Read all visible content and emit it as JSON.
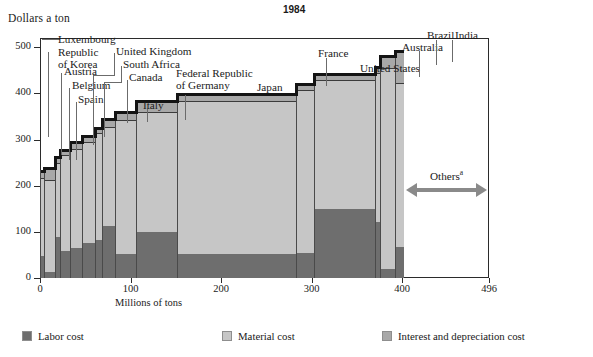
{
  "chart_title": "1984",
  "y_axis": {
    "label": "Dollars a ton",
    "ticks": [
      0,
      100,
      200,
      300,
      400,
      500
    ],
    "min": 0,
    "max": 520
  },
  "x_axis": {
    "label": "Millions of tons",
    "ticks": [
      0,
      100,
      200,
      300,
      400,
      496
    ],
    "min": 0,
    "max": 496
  },
  "legend": [
    {
      "label": "Labor cost",
      "key": "labor",
      "color": "#6e6e6e"
    },
    {
      "label": "Material cost",
      "key": "material",
      "color": "#c6c6c6"
    },
    {
      "label": "Interest and depreciation cost",
      "key": "interest",
      "color": "#a8a8a8"
    }
  ],
  "annotation": {
    "others_label": "Others",
    "others_footnote": "a",
    "others_from": 400,
    "others_to": 496
  },
  "chart_data": {
    "type": "bar",
    "subtype": "marimekko-variable-width-stacked",
    "title": "1984",
    "xlabel": "Millions of tons",
    "ylabel": "Dollars a ton",
    "xlim": [
      0,
      496
    ],
    "ylim": [
      0,
      520
    ],
    "grid": false,
    "legend_position": "bottom",
    "series": [
      {
        "name": "Labor cost",
        "color": "#6e6e6e"
      },
      {
        "name": "Material cost",
        "color": "#c6c6c6"
      },
      {
        "name": "Interest and depreciation cost",
        "color": "#a8a8a8"
      }
    ],
    "bars": [
      {
        "country": "Luxembourg",
        "x_start": 0,
        "width": 4,
        "labor": 48,
        "material": 168,
        "interest": 17,
        "total": 233
      },
      {
        "country": "Republic of Korea",
        "x_start": 4,
        "width": 13,
        "labor": 13,
        "material": 200,
        "interest": 27,
        "total": 240
      },
      {
        "country": "Austria",
        "x_start": 17,
        "width": 5,
        "labor": 88,
        "material": 162,
        "interest": 15,
        "total": 265
      },
      {
        "country": "Belgium",
        "x_start": 22,
        "width": 11,
        "labor": 58,
        "material": 208,
        "interest": 14,
        "total": 280
      },
      {
        "country": "Spain",
        "x_start": 33,
        "width": 13,
        "labor": 65,
        "material": 215,
        "interest": 17,
        "total": 297
      },
      {
        "country": "United Kingdom",
        "x_start": 46,
        "width": 15,
        "labor": 75,
        "material": 220,
        "interest": 14,
        "total": 309
      },
      {
        "country": "South Africa",
        "x_start": 61,
        "width": 8,
        "labor": 82,
        "material": 232,
        "interest": 13,
        "total": 327
      },
      {
        "country": "Canada",
        "x_start": 69,
        "width": 14,
        "labor": 112,
        "material": 215,
        "interest": 20,
        "total": 347
      },
      {
        "country": "Italy",
        "x_start": 83,
        "width": 23,
        "labor": 52,
        "material": 290,
        "interest": 19,
        "total": 361
      },
      {
        "country": "Federal Republic of Germany",
        "x_start": 106,
        "width": 45,
        "labor": 100,
        "material": 260,
        "interest": 25,
        "total": 385
      },
      {
        "country": "Japan",
        "x_start": 151,
        "width": 132,
        "labor": 53,
        "material": 330,
        "interest": 18,
        "total": 401
      },
      {
        "country": "France",
        "x_start": 283,
        "width": 20,
        "labor": 55,
        "material": 352,
        "interest": 16,
        "total": 423
      },
      {
        "country": "United States",
        "x_start": 303,
        "width": 67,
        "labor": 150,
        "material": 278,
        "interest": 17,
        "total": 445
      },
      {
        "country": "Australia",
        "x_start": 370,
        "width": 6,
        "labor": 122,
        "material": 322,
        "interest": 16,
        "total": 460
      },
      {
        "country": "Brazil",
        "x_start": 376,
        "width": 16,
        "labor": 20,
        "material": 435,
        "interest": 28,
        "total": 483
      },
      {
        "country": "India",
        "x_start": 392,
        "width": 10,
        "labor": 68,
        "material": 355,
        "interest": 70,
        "total": 493
      }
    ]
  },
  "labels": [
    {
      "text": "Luxembourg",
      "tx": 58,
      "ty": 34,
      "anchor": "left",
      "dash_x": 52,
      "dash_y": 39,
      "leader": [
        {
          "x": 42,
          "y": 39,
          "w": 10,
          "h": 1
        }
      ]
    },
    {
      "text": "Republic\nof Korea",
      "tx": 58,
      "ty": 47,
      "anchor": "left",
      "leader": [
        {
          "x": 48,
          "y": 52,
          "w": 1,
          "h": 85
        }
      ]
    },
    {
      "text": "Austria",
      "tx": 64,
      "ty": 66,
      "anchor": "left",
      "leader": [
        {
          "x": 61,
          "y": 73,
          "w": 1,
          "h": 82
        }
      ]
    },
    {
      "text": "Belgium",
      "tx": 72,
      "ty": 80,
      "anchor": "left",
      "leader": [
        {
          "x": 69,
          "y": 88,
          "w": 1,
          "h": 72
        }
      ]
    },
    {
      "text": "Spain",
      "tx": 78,
      "ty": 94,
      "anchor": "left",
      "leader": [
        {
          "x": 76,
          "y": 102,
          "w": 1,
          "h": 58
        }
      ]
    },
    {
      "text": "United Kingdom",
      "tx": 116,
      "ty": 46,
      "anchor": "left",
      "leader": [
        {
          "x": 114,
          "y": 53,
          "w": 1,
          "h": 22
        },
        {
          "x": 93,
          "y": 75,
          "w": 22,
          "h": 1
        },
        {
          "x": 93,
          "y": 75,
          "w": 1,
          "h": 70
        }
      ]
    },
    {
      "text": "South Africa",
      "tx": 123,
      "ty": 59,
      "anchor": "left",
      "leader": [
        {
          "x": 121,
          "y": 66,
          "w": 1,
          "h": 16
        },
        {
          "x": 104,
          "y": 82,
          "w": 18,
          "h": 1
        },
        {
          "x": 104,
          "y": 82,
          "w": 1,
          "h": 55
        }
      ]
    },
    {
      "text": "Canada",
      "tx": 129,
      "ty": 72,
      "anchor": "left",
      "leader": [
        {
          "x": 127,
          "y": 80,
          "w": 1,
          "h": 43
        }
      ]
    },
    {
      "text": "Italy",
      "tx": 143,
      "ty": 100,
      "anchor": "left",
      "leader": [
        {
          "x": 147,
          "y": 108,
          "w": 1,
          "h": 14
        }
      ]
    },
    {
      "text": "Federal Republic\nof Germany",
      "tx": 176,
      "ty": 68,
      "anchor": "left",
      "leader": [
        {
          "x": 185,
          "y": 95,
          "w": 1,
          "h": 25
        }
      ]
    },
    {
      "text": "Japan",
      "tx": 257,
      "ty": 82,
      "anchor": "left",
      "leader": []
    },
    {
      "text": "France",
      "tx": 318,
      "ty": 48,
      "anchor": "left",
      "leader": [
        {
          "x": 326,
          "y": 58,
          "w": 1,
          "h": 28
        }
      ]
    },
    {
      "text": "United States",
      "tx": 360,
      "ty": 63,
      "anchor": "left",
      "leader": []
    },
    {
      "text": "Australia",
      "tx": 402,
      "ty": 42,
      "anchor": "left",
      "leader": [
        {
          "x": 419,
          "y": 51,
          "w": 1,
          "h": 26
        }
      ]
    },
    {
      "text": "Brazil",
      "tx": 427,
      "ty": 30,
      "anchor": "left",
      "leader": [
        {
          "x": 436,
          "y": 40,
          "w": 1,
          "h": 25
        }
      ]
    },
    {
      "text": "India",
      "tx": 455,
      "ty": 30,
      "anchor": "left",
      "leader": [
        {
          "x": 452,
          "y": 40,
          "w": 1,
          "h": 22
        }
      ]
    }
  ]
}
